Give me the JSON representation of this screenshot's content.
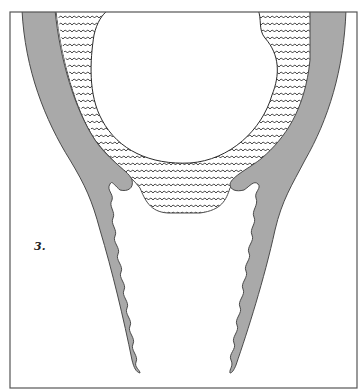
{
  "figure": {
    "label": "3.",
    "colors": {
      "frame": "#555555",
      "band_fill": "#a9a9a9",
      "outline": "#4a4a4a",
      "wave_stroke": "#2a2a2a",
      "background": "#ffffff"
    }
  }
}
